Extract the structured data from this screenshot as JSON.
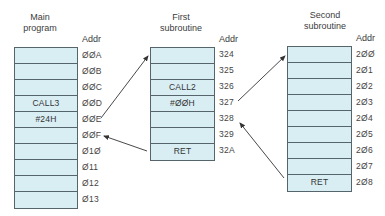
{
  "columns": [
    {
      "title_line1": "Main",
      "title_line2": "program",
      "addr_header": "Addr",
      "cells": [
        "",
        "",
        "",
        "CALL3",
        "#24H",
        "",
        "",
        "",
        "",
        ""
      ],
      "addrs": [
        "ØØA",
        "ØØB",
        "ØØC",
        "ØØD",
        "ØØE",
        "ØØF",
        "Ø1Ø",
        "Ø11",
        "Ø12",
        "Ø13"
      ]
    },
    {
      "title_line1": "First",
      "title_line2": "subroutine",
      "addr_header": "Addr",
      "cells": [
        "",
        "",
        "CALL2",
        "#ØØH",
        "",
        "",
        "RET"
      ],
      "addrs": [
        "324",
        "325",
        "326",
        "327",
        "328",
        "329",
        "32A"
      ]
    },
    {
      "title_line1": "Second",
      "title_line2": "subroutine",
      "addr_header": "Addr",
      "cells": [
        "",
        "",
        "",
        "",
        "",
        "",
        "",
        "",
        "RET"
      ],
      "addrs": [
        "2ØØ",
        "2Ø1",
        "2Ø2",
        "2Ø3",
        "2Ø4",
        "2Ø5",
        "2Ø6",
        "2Ø7",
        "2Ø8"
      ]
    }
  ],
  "arrows": [
    {
      "from": "main ØØE",
      "to": "first 324",
      "label": "call first subroutine"
    },
    {
      "from": "first RET 32A",
      "to": "main ØØF",
      "label": "return to main"
    },
    {
      "from": "first 327",
      "to": "second 2ØØ",
      "label": "call second subroutine"
    },
    {
      "from": "second RET 2Ø8",
      "to": "first 328",
      "label": "return to first"
    }
  ],
  "colors": {
    "cell_fill": "#d9eef3",
    "border": "#56656b",
    "arrow": "#333333"
  }
}
